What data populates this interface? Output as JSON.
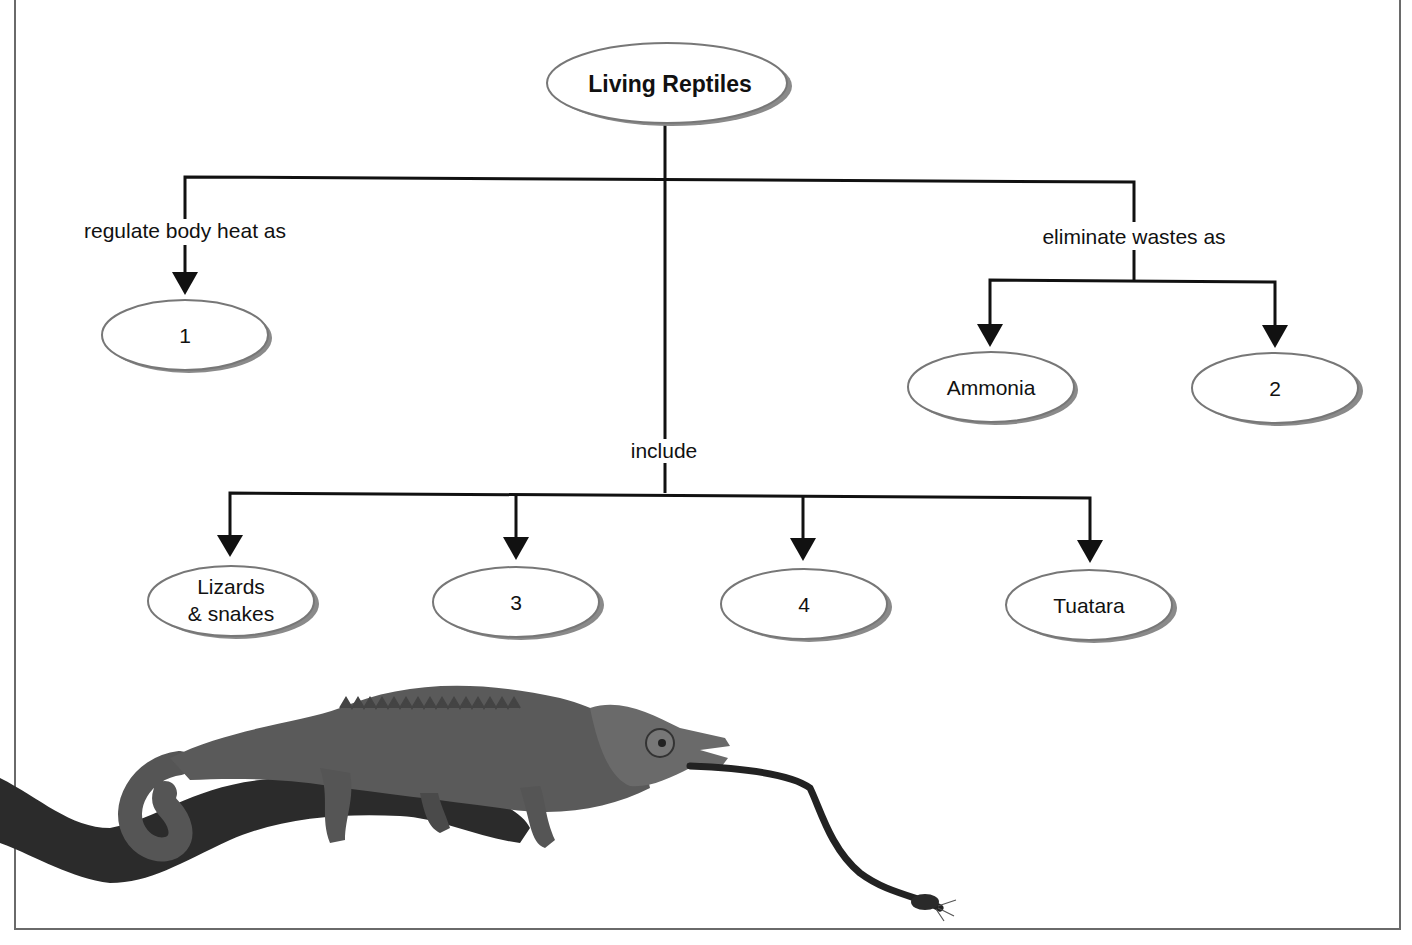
{
  "diagram": {
    "title": "Living Reptiles",
    "root": {
      "label": "Living Reptiles"
    },
    "edges": {
      "regulate": "regulate body heat as",
      "eliminate": "eliminate wastes as",
      "include": "include"
    },
    "nodes": {
      "heat": {
        "label": "1"
      },
      "ammonia": {
        "label": "Ammonia"
      },
      "waste2": {
        "label": "2"
      },
      "lizards_line1": "Lizards",
      "lizards_line2": "& snakes",
      "group3": {
        "label": "3"
      },
      "group4": {
        "label": "4"
      },
      "tuatara": {
        "label": "Tuatara"
      }
    },
    "image": {
      "subject": "chameleon-on-branch",
      "caption": ""
    },
    "colors": {
      "line": "#111111",
      "ellipse_border": "#7a7a7a",
      "ellipse_shadow": "#8a8a8a",
      "frame": "#6a6a6a"
    }
  }
}
